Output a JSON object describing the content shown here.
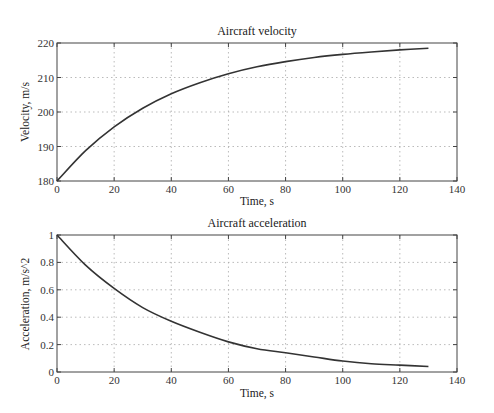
{
  "chart_data": [
    {
      "type": "line",
      "title": "Aircraft velocity",
      "xlabel": "Time, s",
      "ylabel": "Velocity, m/s",
      "xlim": [
        0,
        140
      ],
      "ylim": [
        180,
        220
      ],
      "xticks": [
        0,
        20,
        40,
        60,
        80,
        100,
        120,
        140
      ],
      "yticks": [
        180,
        190,
        200,
        210,
        220
      ],
      "grid": true,
      "series": [
        {
          "name": "velocity",
          "x": [
            0,
            10,
            20,
            30,
            40,
            50,
            60,
            70,
            80,
            90,
            100,
            110,
            120,
            130
          ],
          "y": [
            180.0,
            188.8,
            195.7,
            201.1,
            205.3,
            208.5,
            211.1,
            213.1,
            214.6,
            215.8,
            216.7,
            217.4,
            218.0,
            218.5
          ]
        }
      ]
    },
    {
      "type": "line",
      "title": "Aircraft acceleration",
      "xlabel": "Time, s",
      "ylabel": "Acceleration, m/s^2",
      "xlim": [
        0,
        140
      ],
      "ylim": [
        0,
        1
      ],
      "xticks": [
        0,
        20,
        40,
        60,
        80,
        100,
        120,
        140
      ],
      "yticks": [
        0,
        0.2,
        0.4,
        0.6,
        0.8,
        1
      ],
      "grid": true,
      "series": [
        {
          "name": "acceleration",
          "x": [
            0,
            10,
            20,
            30,
            40,
            50,
            60,
            70,
            80,
            90,
            100,
            110,
            120,
            130
          ],
          "y": [
            1.0,
            0.78,
            0.61,
            0.47,
            0.37,
            0.29,
            0.22,
            0.17,
            0.14,
            0.11,
            0.08,
            0.06,
            0.05,
            0.04
          ]
        }
      ]
    }
  ],
  "labels": {
    "top_title": "Aircraft velocity",
    "top_xlabel": "Time, s",
    "top_ylabel": "Velocity, m/s",
    "bottom_title": "Aircraft acceleration",
    "bottom_xlabel": "Time, s",
    "bottom_ylabel": "Acceleration, m/s^2"
  }
}
